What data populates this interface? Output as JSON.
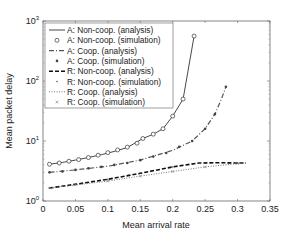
{
  "chart_data": {
    "type": "line",
    "title": "",
    "xlabel": "Mean arrival rate",
    "ylabel": "Mean packet delay",
    "xlim": [
      0,
      0.35
    ],
    "ylim": [
      1,
      1000
    ],
    "yscale": "log",
    "xticks": [
      "0",
      "0.05",
      "0.1",
      "0.15",
      "0.2",
      "0.25",
      "0.3",
      "0.35"
    ],
    "yticks": [
      "10^0",
      "10^1",
      "10^2",
      "10^3"
    ],
    "grid": false,
    "legend_position": "upper left",
    "series": [
      {
        "name": "A: Non-coop. (analysis)",
        "style": "solid",
        "marker": "none",
        "x": [
          0.01,
          0.03,
          0.05,
          0.07,
          0.09,
          0.11,
          0.13,
          0.154,
          0.17,
          0.185,
          0.2,
          0.216,
          0.233
        ],
        "y": [
          4.1,
          4.4,
          4.8,
          5.3,
          5.9,
          6.7,
          7.8,
          11,
          13,
          16,
          26,
          50,
          560
        ]
      },
      {
        "name": "A: Non-coop. (simulation)",
        "style": "none",
        "marker": "circle",
        "x": [
          0.01,
          0.025,
          0.04,
          0.055,
          0.07,
          0.085,
          0.1,
          0.115,
          0.13,
          0.145,
          0.154,
          0.17,
          0.185,
          0.2,
          0.216,
          0.233
        ],
        "y": [
          4.1,
          4.3,
          4.6,
          4.9,
          5.3,
          5.8,
          6.4,
          7.1,
          7.9,
          9.2,
          11,
          13,
          16,
          26,
          50,
          560
        ]
      },
      {
        "name": "A: Coop. (analysis)",
        "style": "dashdot",
        "marker": "none",
        "x": [
          0.01,
          0.05,
          0.1,
          0.15,
          0.2,
          0.23,
          0.25,
          0.265,
          0.275,
          0.282
        ],
        "y": [
          3.0,
          3.3,
          3.8,
          4.8,
          7.0,
          10,
          16,
          28,
          50,
          80
        ]
      },
      {
        "name": "A: Coop. (simulation)",
        "style": "none",
        "marker": "asterisk",
        "x": [
          0.01,
          0.03,
          0.05,
          0.07,
          0.09,
          0.11,
          0.13,
          0.15,
          0.17,
          0.19,
          0.21,
          0.23,
          0.25,
          0.265,
          0.282
        ],
        "y": [
          3.0,
          3.1,
          3.3,
          3.5,
          3.7,
          4.0,
          4.3,
          4.8,
          5.5,
          6.3,
          8.0,
          10,
          16,
          28,
          80
        ]
      },
      {
        "name": "R: Non-coop. (analysis)",
        "style": "dashed",
        "marker": "none",
        "x": [
          0.01,
          0.05,
          0.1,
          0.15,
          0.2,
          0.24,
          0.27,
          0.3,
          0.313
        ],
        "y": [
          1.65,
          1.9,
          2.3,
          2.9,
          3.7,
          4.3,
          4.35,
          4.3,
          4.3
        ]
      },
      {
        "name": "R: Non-coop. (simulation)",
        "style": "none",
        "marker": "dot",
        "x": [
          0.01,
          0.05,
          0.1,
          0.15,
          0.2,
          0.25,
          0.3
        ],
        "y": [
          1.65,
          1.9,
          2.3,
          2.9,
          3.7,
          4.3,
          4.3
        ]
      },
      {
        "name": "R: Coop. (analysis)",
        "style": "dotted",
        "marker": "none",
        "x": [
          0.01,
          0.05,
          0.1,
          0.15,
          0.2,
          0.25,
          0.3,
          0.313
        ],
        "y": [
          1.65,
          1.85,
          2.15,
          2.6,
          3.1,
          3.7,
          4.2,
          4.3
        ]
      },
      {
        "name": "R: Coop. (simulation)",
        "style": "none",
        "marker": "x",
        "x": [
          0.01,
          0.05,
          0.1,
          0.15,
          0.2,
          0.25,
          0.3
        ],
        "y": [
          1.65,
          1.85,
          2.15,
          2.6,
          3.1,
          3.7,
          4.2
        ]
      }
    ]
  }
}
